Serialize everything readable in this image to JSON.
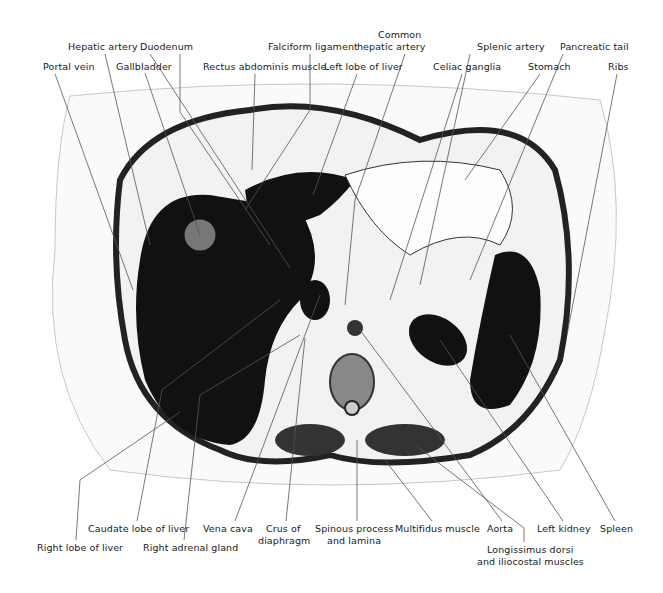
{
  "figure": {
    "type": "anatomical cross-section",
    "background": "#ffffff",
    "tissue_dark": "#111111",
    "tissue_light": "#f4f4f4",
    "leader_line_color": "#555555"
  },
  "labels": {
    "top": [
      {
        "id": "hepatic-artery",
        "text": "Hepatic artery",
        "x": 98,
        "y": 47
      },
      {
        "id": "duodenum",
        "text": "Duodenum",
        "x": 160,
        "y": 47
      },
      {
        "id": "falciform-ligament",
        "text": "Falciform ligament",
        "x": 268,
        "y": 47
      },
      {
        "id": "common-hepatic-artery-1",
        "text": "Common",
        "x": 394,
        "y": 35
      },
      {
        "id": "common-hepatic-artery-2",
        "text": "hepatic artery",
        "x": 394,
        "y": 47
      },
      {
        "id": "splenic-artery",
        "text": "Splenic artery",
        "x": 475,
        "y": 47
      },
      {
        "id": "pancreatic-tail",
        "text": "Pancreatic tail",
        "x": 564,
        "y": 47
      },
      {
        "id": "portal-vein",
        "text": "Portal vein",
        "x": 44,
        "y": 67
      },
      {
        "id": "gallbladder",
        "text": "Gallbladder",
        "x": 141,
        "y": 67
      },
      {
        "id": "rectus-abdominis-muscle",
        "text": "Rectus abdominis muscle",
        "x": 254,
        "y": 67
      },
      {
        "id": "left-lobe-of-liver",
        "text": "Left lobe of liver",
        "x": 356,
        "y": 67
      },
      {
        "id": "celiac-ganglia",
        "text": "Celiac ganglia",
        "x": 467,
        "y": 67
      },
      {
        "id": "stomach",
        "text": "Stomach",
        "x": 541,
        "y": 67
      },
      {
        "id": "ribs",
        "text": "Ribs",
        "x": 617,
        "y": 67
      }
    ],
    "bottom": [
      {
        "id": "caudate-lobe-of-liver",
        "text": "Caudate lobe of liver",
        "x": 137,
        "y": 528
      },
      {
        "id": "vena-cava",
        "text": "Vena cava",
        "x": 235,
        "y": 528
      },
      {
        "id": "crus-of-diaphragm-1",
        "text": "Crus of",
        "x": 286,
        "y": 528
      },
      {
        "id": "crus-of-diaphragm-2",
        "text": "diaphragm",
        "x": 286,
        "y": 540
      },
      {
        "id": "spinous-process-1",
        "text": "Spinous process",
        "x": 357,
        "y": 528
      },
      {
        "id": "spinous-process-2",
        "text": "and lamina",
        "x": 357,
        "y": 540
      },
      {
        "id": "multifidus-muscle",
        "text": "Multifidus muscle",
        "x": 432,
        "y": 528
      },
      {
        "id": "aorta",
        "text": "Aorta",
        "x": 502,
        "y": 528
      },
      {
        "id": "left-kidney",
        "text": "Left kidney",
        "x": 563,
        "y": 528
      },
      {
        "id": "spleen",
        "text": "Spleen",
        "x": 615,
        "y": 528
      },
      {
        "id": "right-lobe-of-liver",
        "text": "Right lobe of liver",
        "x": 76,
        "y": 547
      },
      {
        "id": "right-adrenal-gland",
        "text": "Right adrenal gland",
        "x": 184,
        "y": 547
      },
      {
        "id": "longissimus-1",
        "text": "Longissimus dorsi",
        "x": 524,
        "y": 549
      },
      {
        "id": "longissimus-2",
        "text": "and iliocostal muscles",
        "x": 524,
        "y": 561
      }
    ]
  }
}
